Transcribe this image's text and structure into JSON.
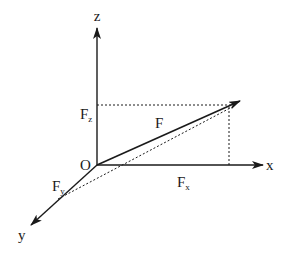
{
  "diagram": {
    "type": "3d-force-vector-components",
    "colors": {
      "line": "#1a1a1a",
      "background": "#ffffff"
    },
    "origin": {
      "label": "O",
      "x": 97,
      "y": 165
    },
    "axes": {
      "z": {
        "label": "z",
        "end": [
          97,
          28
        ],
        "label_pos": [
          97,
          21
        ]
      },
      "x": {
        "label": "x",
        "end": [
          263,
          165
        ],
        "label_pos": [
          271,
          170
        ]
      },
      "y": {
        "label": "y",
        "end": [
          31,
          225
        ],
        "label_pos": [
          23,
          240
        ]
      }
    },
    "vector": {
      "label": "F",
      "tip": [
        240,
        101
      ],
      "label_pos": [
        158,
        128
      ]
    },
    "components": {
      "Fx": {
        "label": "F",
        "subscript": "x",
        "label_pos": [
          178,
          186
        ]
      },
      "Fy": {
        "label": "F",
        "subscript": "y",
        "label_pos": [
          52,
          191
        ]
      },
      "Fz": {
        "label": "F",
        "subscript": "z",
        "label_pos": [
          80,
          119
        ]
      }
    },
    "dashed_lines": [
      {
        "name": "fz-projection",
        "from": [
          97,
          105
        ],
        "to": [
          232,
          105
        ]
      },
      {
        "name": "fx-projection",
        "from": [
          229,
          107
        ],
        "to": [
          229,
          165
        ]
      },
      {
        "name": "xy-projection",
        "from": [
          58,
          199
        ],
        "to": [
          234,
          106
        ]
      }
    ]
  }
}
